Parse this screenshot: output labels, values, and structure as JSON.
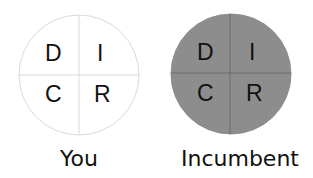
{
  "diagram": {
    "circles": [
      {
        "id": "you",
        "caption": "You",
        "fill": "#ffffff",
        "stroke": "#d9d9d9",
        "divider": "#d9d9d9",
        "quadrants": {
          "top_left": "D",
          "top_right": "I",
          "bottom_left": "C",
          "bottom_right": "R"
        }
      },
      {
        "id": "incumbent",
        "caption": "Incumbent",
        "fill": "#8d8d8d",
        "stroke": "#8d8d8d",
        "divider": "#6b6b6b",
        "quadrants": {
          "top_left": "D",
          "top_right": "I",
          "bottom_left": "C",
          "bottom_right": "R"
        }
      }
    ]
  }
}
